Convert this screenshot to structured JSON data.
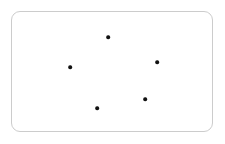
{
  "canvas": {
    "width": 225,
    "height": 144,
    "background_color": "#ffffff"
  },
  "card": {
    "name": "rounded-rectangle-card",
    "x": 11,
    "y": 11,
    "width": 202,
    "height": 121,
    "corner_radius": 9,
    "border_width": 1,
    "border_color": "#cccccc",
    "fill_color": "#ffffff"
  },
  "chart_data": {
    "type": "scatter",
    "title": "",
    "subtitle": "",
    "xlabel": "",
    "ylabel": "",
    "grid": false,
    "legend": false,
    "legend_position": "none",
    "axes_visible": false,
    "tick_labels_x": [],
    "tick_labels_y": [],
    "xlim": [
      0,
      225
    ],
    "ylim": [
      144,
      0
    ],
    "marker": {
      "shape": "circle",
      "color": "#111111",
      "size_px": 3.6
    },
    "point_count": 5,
    "points": [
      {
        "label": "point-1",
        "x": 108,
        "y": 37
      },
      {
        "label": "point-2",
        "x": 157,
        "y": 62
      },
      {
        "label": "point-3",
        "x": 70,
        "y": 67
      },
      {
        "label": "point-4",
        "x": 145,
        "y": 99
      },
      {
        "label": "point-5",
        "x": 97,
        "y": 108
      }
    ]
  }
}
